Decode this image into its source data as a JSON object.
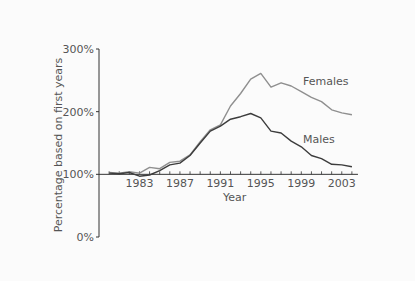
{
  "chart_data": {
    "type": "line",
    "title": "",
    "xlabel": "Year",
    "ylabel": "Percentage based on first years",
    "xlim": [
      1979,
      2005
    ],
    "ylim": [
      0,
      300
    ],
    "x": [
      1980,
      1981,
      1982,
      1983,
      1984,
      1985,
      1986,
      1987,
      1988,
      1989,
      1990,
      1991,
      1992,
      1993,
      1994,
      1995,
      1996,
      1997,
      1998,
      1999,
      2000,
      2001,
      2002,
      2003,
      2004
    ],
    "x_ticks": [
      1980,
      1981,
      1982,
      1983,
      1984,
      1985,
      1986,
      1987,
      1988,
      1989,
      1990,
      1991,
      1992,
      1993,
      1994,
      1995,
      1996,
      1997,
      1998,
      1999,
      2000,
      2001,
      2002,
      2003,
      2004
    ],
    "x_tick_labels": [
      {
        "value": 1983,
        "label": "1983"
      },
      {
        "value": 1987,
        "label": "1987"
      },
      {
        "value": 1991,
        "label": "1991"
      },
      {
        "value": 1995,
        "label": "1995"
      },
      {
        "value": 1999,
        "label": "1999"
      },
      {
        "value": 2003,
        "label": "2003"
      }
    ],
    "y_ticks": [
      {
        "value": 0,
        "label": "0%"
      },
      {
        "value": 100,
        "label": "100%"
      },
      {
        "value": 200,
        "label": "200%"
      },
      {
        "value": 300,
        "label": "300%"
      }
    ],
    "x_axis_at": 100,
    "grid": false,
    "legend": "inline-labels-right",
    "series": [
      {
        "name": "Females",
        "color": "#8f8f8f",
        "values": [
          103,
          102,
          104,
          102,
          111,
          109,
          119,
          121,
          131,
          152,
          171,
          179,
          209,
          229,
          252,
          261,
          239,
          246,
          241,
          232,
          223,
          216,
          203,
          198,
          195
        ]
      },
      {
        "name": "Males",
        "color": "#3c3c3c",
        "values": [
          102,
          101,
          103,
          97,
          99,
          106,
          115,
          118,
          130,
          150,
          169,
          177,
          188,
          192,
          197,
          190,
          169,
          166,
          153,
          144,
          130,
          125,
          116,
          115,
          112
        ]
      }
    ]
  }
}
